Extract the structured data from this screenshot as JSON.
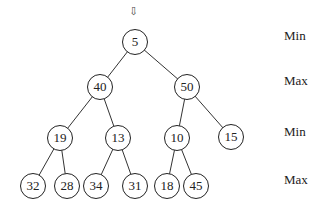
{
  "arrow": "⇩",
  "nodes": [
    {
      "id": "n0",
      "value": "5",
      "x": 135,
      "y": 42
    },
    {
      "id": "n1",
      "value": "40",
      "x": 100,
      "y": 87
    },
    {
      "id": "n2",
      "value": "50",
      "x": 187,
      "y": 87
    },
    {
      "id": "n3",
      "value": "19",
      "x": 60,
      "y": 138
    },
    {
      "id": "n4",
      "value": "13",
      "x": 118,
      "y": 138
    },
    {
      "id": "n5",
      "value": "10",
      "x": 177,
      "y": 138
    },
    {
      "id": "n6",
      "value": "15",
      "x": 231,
      "y": 137
    },
    {
      "id": "n7",
      "value": "32",
      "x": 33,
      "y": 186
    },
    {
      "id": "n8",
      "value": "28",
      "x": 67,
      "y": 186
    },
    {
      "id": "n9",
      "value": "34",
      "x": 96,
      "y": 186
    },
    {
      "id": "n10",
      "value": "31",
      "x": 135,
      "y": 186
    },
    {
      "id": "n11",
      "value": "18",
      "x": 167,
      "y": 186
    },
    {
      "id": "n12",
      "value": "45",
      "x": 196,
      "y": 186
    }
  ],
  "edges": [
    [
      "n0",
      "n1"
    ],
    [
      "n0",
      "n2"
    ],
    [
      "n1",
      "n3"
    ],
    [
      "n1",
      "n4"
    ],
    [
      "n2",
      "n5"
    ],
    [
      "n2",
      "n6"
    ],
    [
      "n3",
      "n7"
    ],
    [
      "n3",
      "n8"
    ],
    [
      "n4",
      "n9"
    ],
    [
      "n4",
      "n10"
    ],
    [
      "n5",
      "n11"
    ],
    [
      "n5",
      "n12"
    ]
  ],
  "levels": [
    {
      "label": "Min",
      "y": 42
    },
    {
      "label": "Max",
      "y": 87
    },
    {
      "label": "Min",
      "y": 138
    },
    {
      "label": "Max",
      "y": 186
    }
  ]
}
